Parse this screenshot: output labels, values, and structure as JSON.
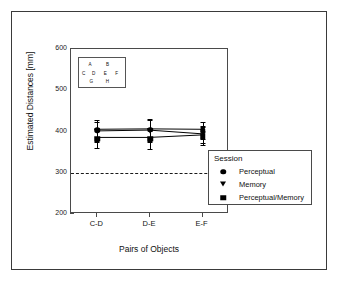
{
  "chart_data": {
    "type": "line",
    "title": "",
    "xlabel": "Pairs of Objects",
    "ylabel": "Estimated Distances [mm]",
    "categories": [
      "C-D",
      "D-E",
      "E-F"
    ],
    "ylim": [
      200,
      600
    ],
    "yticks": [
      200,
      300,
      400,
      500,
      600
    ],
    "grid": false,
    "legend_position": "bottom-right-outside",
    "reference_line": {
      "y": 300,
      "style": "dashed"
    },
    "series": [
      {
        "name": "Perceptual",
        "marker": "circle",
        "values": [
          403,
          404,
          403
        ],
        "errors": [
          25,
          27,
          21
        ]
      },
      {
        "name": "Memory",
        "marker": "triangle-down",
        "values": [
          399,
          401,
          392
        ],
        "errors": [
          25,
          27,
          21
        ]
      },
      {
        "name": "Perceptual/Memory",
        "marker": "square",
        "values": [
          383,
          383,
          389
        ],
        "errors": [
          24,
          26,
          22
        ]
      }
    ]
  },
  "legend": {
    "title": "Session",
    "entries": [
      {
        "label": "Perceptual",
        "marker": "circle"
      },
      {
        "label": "Memory",
        "marker": "triangle-down"
      },
      {
        "label": "Perceptual/Memory",
        "marker": "square"
      }
    ]
  },
  "inset": {
    "letters": [
      {
        "text": "A",
        "x": 24,
        "y": 20
      },
      {
        "text": "B",
        "x": 62,
        "y": 20
      },
      {
        "text": "C",
        "x": 10,
        "y": 50
      },
      {
        "text": "D",
        "x": 32,
        "y": 50
      },
      {
        "text": "E",
        "x": 57,
        "y": 50
      },
      {
        "text": "F",
        "x": 82,
        "y": 50
      },
      {
        "text": "G",
        "x": 27,
        "y": 78
      },
      {
        "text": "H",
        "x": 62,
        "y": 78
      }
    ]
  },
  "colors": {
    "marker": "#000000",
    "axis": "#4a4a4a",
    "frame": "#3a3a3a",
    "text": "#111111"
  }
}
